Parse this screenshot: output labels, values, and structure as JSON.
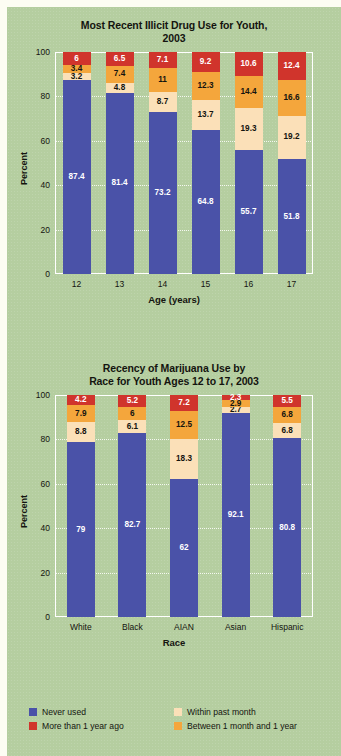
{
  "colors": {
    "background": "#b5cea0",
    "page_margin": "#fdfdf3",
    "never_used": "#4a52a8",
    "more_than_1_year": "#d0342c",
    "between_1_month_and_1_year": "#f4a63c",
    "within_past_month": "#fbe0b8",
    "axis": "#ffffff",
    "text": "#14140f"
  },
  "legend": {
    "items": [
      {
        "label": "Never used",
        "color_key": "never_used",
        "swatch": "#4a52a8"
      },
      {
        "label": "Within past month",
        "color_key": "within_past_month",
        "swatch": "#fbe0b8"
      },
      {
        "label": "More than 1 year ago",
        "color_key": "more_than_1_year",
        "swatch": "#d0342c"
      },
      {
        "label": "Between 1 month and 1 year",
        "color_key": "between_1_month_and_1_year",
        "swatch": "#f4a63c"
      }
    ]
  },
  "chart_data": [
    {
      "type": "bar",
      "stacked": true,
      "title": "Most Recent Illicit Drug Use for Youth, 2003",
      "title_line1": "Most Recent Illicit Drug Use for Youth,",
      "title_line2": "2003",
      "xlabel": "Age (years)",
      "ylabel": "Percent",
      "categories": [
        "12",
        "13",
        "14",
        "15",
        "16",
        "17"
      ],
      "ylim": [
        0,
        100
      ],
      "yticks": [
        0,
        20,
        40,
        60,
        80,
        100
      ],
      "grid": true,
      "legend_position": "bottom",
      "series": [
        {
          "name": "Never used",
          "color": "#4a52a8",
          "values": [
            87.4,
            81.4,
            73.2,
            64.8,
            55.7,
            51.8
          ]
        },
        {
          "name": "Within past month",
          "color": "#fbe0b8",
          "values": [
            3.2,
            4.8,
            8.7,
            13.7,
            19.3,
            19.2
          ]
        },
        {
          "name": "Between 1 month and 1 year",
          "color": "#f4a63c",
          "values": [
            3.4,
            7.4,
            11,
            12.3,
            14.4,
            16.6
          ]
        },
        {
          "name": "More than 1 year ago",
          "color": "#d0342c",
          "values": [
            6.0,
            6.5,
            7.1,
            9.2,
            10.6,
            12.4
          ]
        }
      ]
    },
    {
      "type": "bar",
      "stacked": true,
      "title": "Recency of Marijuana Use by Race for Youth Ages 12 to 17, 2003",
      "title_line1": "Recency of Marijuana Use by",
      "title_line2": "Race for Youth Ages 12 to 17, 2003",
      "xlabel": "Race",
      "ylabel": "Percent",
      "categories": [
        "White",
        "Black",
        "AIAN",
        "Asian",
        "Hispanic"
      ],
      "ylim": [
        0,
        100
      ],
      "yticks": [
        0,
        20,
        40,
        60,
        80,
        100
      ],
      "grid": true,
      "legend_position": "bottom",
      "series": [
        {
          "name": "Never used",
          "color": "#4a52a8",
          "values": [
            79.0,
            82.7,
            62.0,
            92.1,
            80.8
          ]
        },
        {
          "name": "Within past month",
          "color": "#fbe0b8",
          "values": [
            8.8,
            6.1,
            18.3,
            2.7,
            6.8
          ]
        },
        {
          "name": "Between 1 month and 1 year",
          "color": "#f4a63c",
          "values": [
            7.9,
            6,
            12.5,
            2.9,
            6.8
          ]
        },
        {
          "name": "More than 1 year ago",
          "color": "#d0342c",
          "values": [
            4.2,
            5.2,
            7.2,
            2.3,
            5.5
          ]
        }
      ]
    }
  ]
}
